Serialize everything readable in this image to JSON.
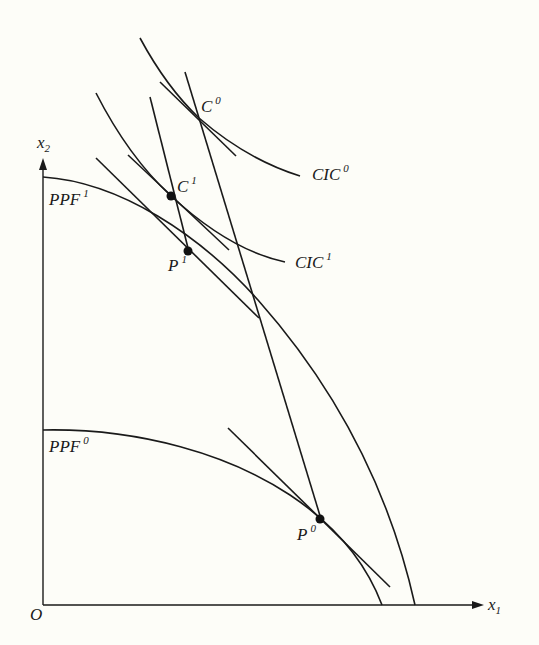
{
  "diagram": {
    "axes": {
      "origin_label": "O",
      "x_axis": {
        "label": "x",
        "subscript": "1"
      },
      "y_axis": {
        "label": "x",
        "subscript": "2"
      }
    },
    "curves": [
      {
        "id": "PPF1",
        "label": "PPF",
        "superscript": "1",
        "type": "production-possibility-frontier"
      },
      {
        "id": "PPF0",
        "label": "PPF",
        "superscript": "0",
        "type": "production-possibility-frontier"
      },
      {
        "id": "CIC0",
        "label": "CIC",
        "superscript": "0",
        "type": "community-indifference-curve"
      },
      {
        "id": "CIC1",
        "label": "CIC",
        "superscript": "1",
        "type": "community-indifference-curve"
      }
    ],
    "points": [
      {
        "id": "C0",
        "label": "C",
        "superscript": "0"
      },
      {
        "id": "C1",
        "label": "C",
        "superscript": "1"
      },
      {
        "id": "P1",
        "label": "P",
        "superscript": "1"
      },
      {
        "id": "P0",
        "label": "P",
        "superscript": "0"
      }
    ]
  }
}
